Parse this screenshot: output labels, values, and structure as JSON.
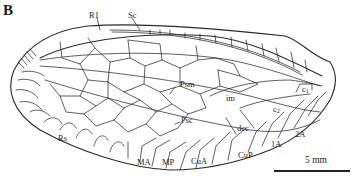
{
  "figure": {
    "panel_letter": "B",
    "labels": {
      "R1": "R1",
      "Sc": "Sc",
      "Psm": "Psm",
      "im": "im",
      "c1": "c",
      "c1_sub": "1",
      "c2": "c",
      "c2_sub": "2",
      "Psc": "Psc",
      "dcc": "dcc",
      "Rs": "Rs",
      "MA": "MA",
      "MP": "MP",
      "CuA": "CuA",
      "CuP": "CuP",
      "1A": "1A",
      "2A": "2A"
    },
    "scale_bar": {
      "label": "5 mm"
    },
    "colors": {
      "line": "#2a2a2a",
      "background": "#ffffff"
    }
  }
}
